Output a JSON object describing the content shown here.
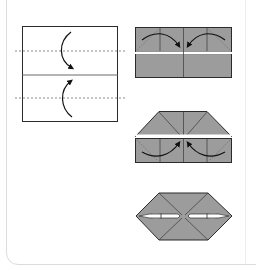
{
  "diagram": {
    "title": "",
    "steps": [
      {
        "id": "step-1",
        "description": "Square sheet with two horizontal valley-fold lines; fold top and bottom edges to the center crease"
      },
      {
        "id": "step-2",
        "description": "Folded rectangle; fold top corners inward toward center"
      },
      {
        "id": "step-3",
        "description": "Top corners folded; fold bottom corners inward toward center"
      },
      {
        "id": "step-4",
        "description": "Finished hexagon shape"
      }
    ],
    "colors": {
      "paper_front": "#ffffff",
      "paper_back": "#9c9c9c",
      "outline": "#2b2b2b",
      "crease": "#555555",
      "valley_fold": "#8a8a8a",
      "arrow": "#111111",
      "card_border": "#dcdcdc"
    }
  }
}
